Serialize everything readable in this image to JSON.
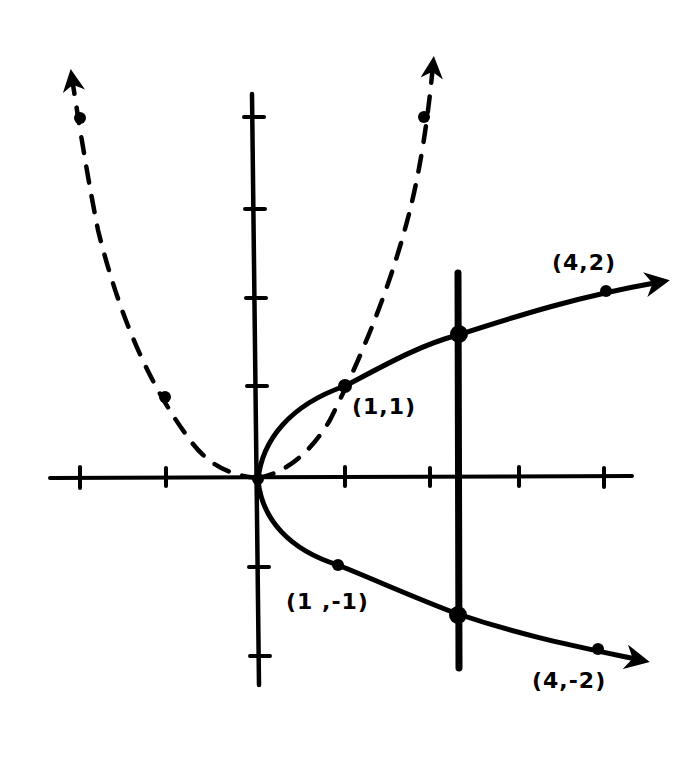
{
  "diagram": {
    "type": "hand-drawn coordinate graph (vertical line test)",
    "colors": {
      "ink": "#000000",
      "background": "#ffffff"
    },
    "axes": {
      "origin_px": [
        258,
        478
      ],
      "unit_px": {
        "x": 87,
        "y": 88
      },
      "x_ticks": [
        -2,
        -1,
        1,
        2,
        3,
        4
      ],
      "y_ticks": [
        -2,
        -1,
        1,
        2,
        3,
        4
      ]
    },
    "curves": [
      {
        "name": "sideways-parabola",
        "relation": "x = y^2",
        "style": "solid",
        "arrows": [
          "upper-right",
          "lower-right"
        ],
        "marked_points": [
          [
            0,
            0
          ],
          [
            1,
            1
          ],
          [
            1,
            -1
          ],
          [
            4,
            2
          ],
          [
            4,
            -2
          ]
        ]
      },
      {
        "name": "upright-parabola",
        "relation": "y = x^2",
        "style": "dashed",
        "arrows": [
          "upper-left",
          "upper-right"
        ],
        "marked_points": [
          [
            -2,
            4
          ],
          [
            -1,
            1
          ],
          [
            1,
            1
          ],
          [
            2,
            4
          ]
        ]
      }
    ],
    "vertical_line": {
      "x_approx": 2.3,
      "style": "solid-thick",
      "intersections": [
        [
          2.3,
          1.6
        ],
        [
          2.3,
          -1.6
        ]
      ]
    },
    "labels": {
      "p_1_1": "(1,1)",
      "p_1_neg1": "(1 ,-1)",
      "p_4_2": "(4,2)",
      "p_4_neg2": "(4,-2)"
    }
  }
}
